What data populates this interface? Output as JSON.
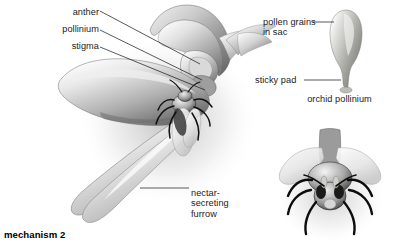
{
  "figure": {
    "background_color": "#ffffff",
    "text_color": "#1a1a1a",
    "width": 393,
    "height": 246
  },
  "labels": {
    "anther": "anther",
    "pollinium": "pollinium",
    "stigma": "stigma",
    "nectar_furrow": "nectar-\nsecreting\nfurrow",
    "pollen_grains": "pollen grains\nin sac",
    "sticky_pad": "sticky pad"
  },
  "captions": {
    "orchid_pollinium": "orchid pollinium",
    "mechanism": "mechanism 2"
  },
  "illustrations": [
    {
      "name": "orchid-flower-with-bee",
      "description": "grayscale airbrush illustration of an orchid flower in side view with a bee entering the throat",
      "parts": [
        "anther",
        "pollinium",
        "stigma",
        "nectar-secreting furrow",
        "labellum",
        "petals",
        "bee"
      ]
    },
    {
      "name": "orchid-pollinium-detail",
      "description": "enlarged grayscale club-shaped pollinium with pollen sac and stalk ending in a sticky pad",
      "parts": [
        "pollen grains in sac",
        "stalk",
        "sticky pad"
      ]
    },
    {
      "name": "bee-front-view-with-pollinia",
      "description": "grayscale front view of a bee with wings spread and pollinia attached to the head"
    }
  ]
}
